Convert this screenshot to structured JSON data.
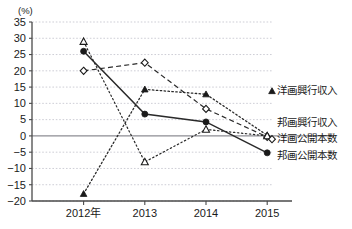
{
  "chart": {
    "type": "line",
    "unit_label": "(%)",
    "xlabel": "",
    "ylabel": "",
    "categories": [
      "2012年",
      "2013",
      "2014",
      "2015"
    ],
    "ylim": [
      -20,
      35
    ],
    "ytick_step": 5,
    "yticks": [
      "35",
      "30",
      "25",
      "20",
      "15",
      "10",
      "5",
      "0",
      "-5",
      "-10",
      "-15",
      "-20"
    ],
    "grid": true,
    "legend_position": "right",
    "series": [
      {
        "name": "洋画興行収入",
        "marker": "filled-triangle",
        "line": "dotted",
        "values": [
          -17.8,
          14.3,
          12.8,
          0.2
        ]
      },
      {
        "name": "邦画興行収入",
        "marker": "filled-circle",
        "line": "solid",
        "values": [
          26.0,
          6.7,
          4.3,
          -5.2
        ]
      },
      {
        "name": "洋画公開本数",
        "marker": "open-diamond",
        "line": "dashed",
        "values": [
          20.0,
          22.5,
          8.3,
          -0.3
        ]
      },
      {
        "name": "邦画公開本数",
        "marker": "open-triangle",
        "line": "fine-dot",
        "values": [
          29.0,
          -8.0,
          2.0,
          0.0
        ]
      }
    ]
  },
  "legend": {
    "items": [
      {
        "label": "洋画興行収入"
      },
      {
        "label": "邦画興行収入"
      },
      {
        "label": "洋画公開本数"
      },
      {
        "label": "邦画公開本数"
      }
    ]
  }
}
